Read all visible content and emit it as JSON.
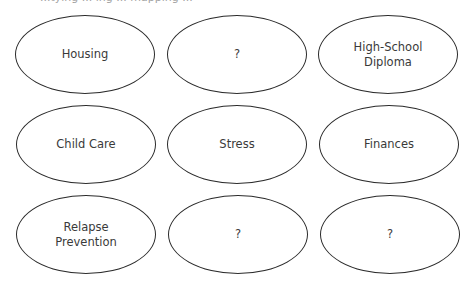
{
  "diagram": {
    "caption_clipped": "...tying ... ing ... mapping ...",
    "nodes": [
      {
        "label": "Housing",
        "row": 0,
        "col": 0
      },
      {
        "label": "?",
        "row": 0,
        "col": 1
      },
      {
        "label": "High-School\nDiploma",
        "row": 0,
        "col": 2
      },
      {
        "label": "Child Care",
        "row": 1,
        "col": 0
      },
      {
        "label": "Stress",
        "row": 1,
        "col": 1
      },
      {
        "label": "Finances",
        "row": 1,
        "col": 2
      },
      {
        "label": "Relapse\nPrevention",
        "row": 2,
        "col": 0
      },
      {
        "label": "?",
        "row": 2,
        "col": 1
      },
      {
        "label": "?",
        "row": 2,
        "col": 2
      }
    ]
  }
}
